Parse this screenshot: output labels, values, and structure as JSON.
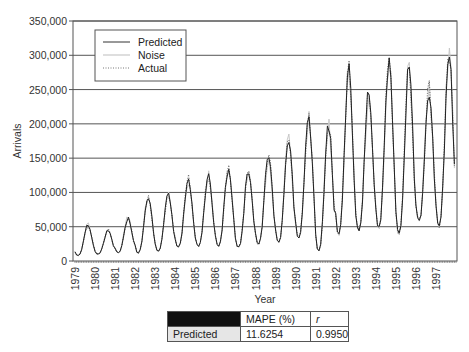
{
  "chart_data": {
    "type": "line",
    "title": "",
    "xlabel": "Year",
    "ylabel": "Arrivals",
    "ylim": [
      0,
      350000
    ],
    "yticks": [
      0,
      50000,
      100000,
      150000,
      200000,
      250000,
      300000,
      350000
    ],
    "ytick_labels": [
      "0",
      "50,000",
      "100,000",
      "150,000",
      "200,000",
      "250,000",
      "300,000",
      "350,000"
    ],
    "xticks": [
      "1979",
      "1980",
      "1981",
      "1982",
      "1983",
      "1984",
      "1985",
      "1986",
      "1987",
      "1988",
      "1989",
      "1990",
      "1991",
      "1992",
      "1993",
      "1994",
      "1995",
      "1996",
      "1997"
    ],
    "grid": "horizontal",
    "legend_position": "upper-left",
    "legend": [
      "Predicted",
      "Noise",
      "Actual"
    ],
    "annual_peaks": [
      52000,
      45000,
      62000,
      95000,
      95000,
      120000,
      125000,
      133000,
      132000,
      153000,
      178000,
      205000,
      200000,
      278000,
      245000,
      293000,
      283000,
      250000,
      305000
    ],
    "annual_troughs": [
      8000,
      10000,
      12000,
      12000,
      15000,
      20000,
      22000,
      22000,
      20000,
      25000,
      28000,
      35000,
      15000,
      40000,
      45000,
      50000,
      40000,
      60000,
      50000
    ],
    "series": [
      {
        "name": "Predicted",
        "style": "solid",
        "color": "#222222"
      },
      {
        "name": "Noise",
        "style": "solid",
        "color": "#c8c8c8"
      },
      {
        "name": "Actual",
        "style": "dotted",
        "color": "#666666"
      }
    ]
  },
  "legend": {
    "items": [
      {
        "label": "Predicted"
      },
      {
        "label": "Noise"
      },
      {
        "label": "Actual"
      }
    ]
  },
  "axes": {
    "x_title": "Year",
    "y_title": "Arrivals"
  },
  "table": {
    "header": [
      "",
      "MAPE (%)",
      "r"
    ],
    "rows": [
      [
        "Predicted",
        "11.6254",
        "0.9950"
      ]
    ]
  }
}
